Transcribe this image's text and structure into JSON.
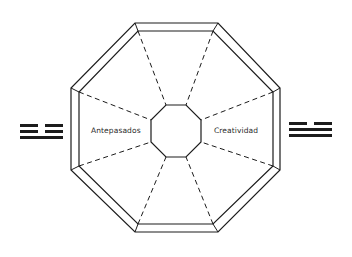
{
  "diagram": {
    "type": "bagua-octagon",
    "labels": {
      "left": "Antepasados",
      "right": "Creatividad"
    },
    "trigrams": {
      "left": {
        "lines_top_to_bottom": [
          "broken",
          "broken",
          "solid"
        ]
      },
      "right": {
        "lines_top_to_bottom": [
          "broken",
          "solid",
          "solid"
        ]
      }
    },
    "colors": {
      "stroke": "#1c1c1c",
      "background": "#ffffff",
      "text": "#2a2a2a"
    }
  }
}
